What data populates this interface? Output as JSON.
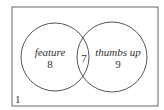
{
  "diagram": {
    "type": "venn",
    "universe_label": "1",
    "sets": [
      {
        "name": "feature",
        "only_count": "8"
      },
      {
        "name": "thumbs up",
        "only_count": "9"
      }
    ],
    "intersection_count": "7",
    "colors": {
      "stroke": "#555555",
      "text": "#333333",
      "background": "#ffffff"
    }
  }
}
